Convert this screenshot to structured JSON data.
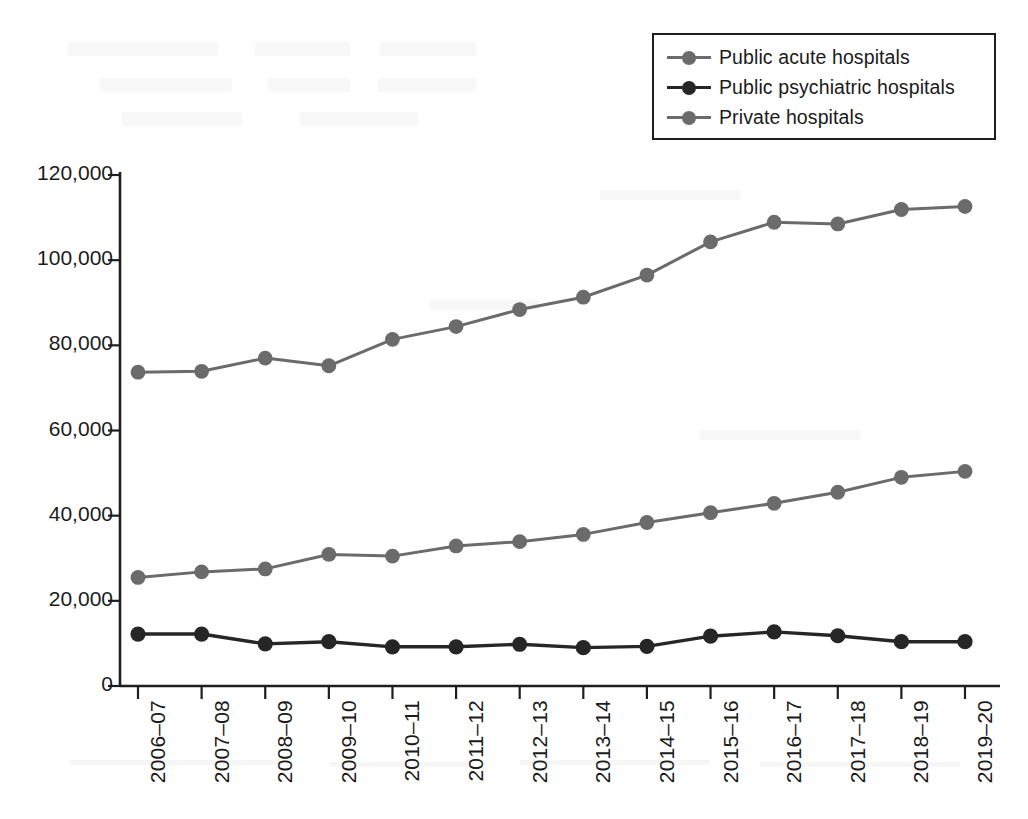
{
  "chart_data": {
    "type": "line",
    "title": "",
    "subtitle": "",
    "xlabel": "",
    "ylabel": "",
    "grid": false,
    "legend_position": "top-right",
    "categories": [
      "2006–07",
      "2007–08",
      "2008–09",
      "2009–10",
      "2010–11",
      "2011–12",
      "2012–13",
      "2013–14",
      "2014–15",
      "2015–16",
      "2016–17",
      "2017–18",
      "2018–19",
      "2019–20"
    ],
    "ylim": [
      0,
      120000
    ],
    "yticks": [
      0,
      20000,
      40000,
      60000,
      80000,
      100000,
      120000
    ],
    "ytick_labels": [
      "0",
      "20,000",
      "40,000",
      "60,000",
      "80,000",
      "100,000",
      "120,000"
    ],
    "series": [
      {
        "name": "Public acute hospitals",
        "color": "#6b6b6b",
        "values": [
          73700,
          73900,
          77000,
          75200,
          81400,
          84400,
          88400,
          91300,
          96500,
          104300,
          108900,
          108500,
          111900,
          112600
        ]
      },
      {
        "name": "Public psychiatric hospitals",
        "color": "#262626",
        "values": [
          12200,
          12200,
          9900,
          10400,
          9200,
          9200,
          9800,
          9000,
          9300,
          11700,
          12700,
          11800,
          10400,
          10400
        ]
      },
      {
        "name": "Private hospitals",
        "color": "#6b6b6b",
        "values": [
          25500,
          26800,
          27500,
          30900,
          30500,
          32900,
          33900,
          35600,
          38400,
          40700,
          42900,
          45500,
          49000,
          50400
        ]
      }
    ]
  },
  "legend": {
    "entries": [
      {
        "label": "Public acute hospitals",
        "color": "#6b6b6b"
      },
      {
        "label": "Public psychiatric hospitals",
        "color": "#262626"
      },
      {
        "label": "Private hospitals",
        "color": "#6b6b6b"
      }
    ]
  },
  "axes": {
    "y_tick_labels": [
      "120,000",
      "100,000",
      "80,000",
      "60,000",
      "40,000",
      "20,000",
      "0"
    ],
    "x_tick_labels": [
      "2006–07",
      "2007–08",
      "2008–09",
      "2009–10",
      "2010–11",
      "2011–12",
      "2012–13",
      "2013–14",
      "2014–15",
      "2015–16",
      "2016–17",
      "2017–18",
      "2018–19",
      "2019–20"
    ],
    "axis_color": "#1e1e1e"
  }
}
